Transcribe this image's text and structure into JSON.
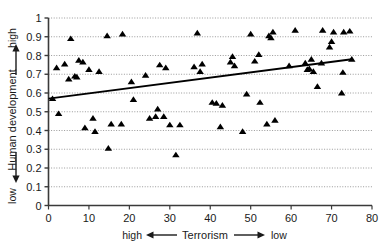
{
  "chart_data": {
    "type": "scatter",
    "title": "",
    "subtitle": "",
    "xlabel": "Terrorism",
    "ylabel": "Human development",
    "xlim": [
      0,
      80
    ],
    "ylim": [
      0,
      1
    ],
    "grid": true,
    "grid_axis": "y",
    "grid_style": "dotted",
    "legend": "none",
    "marker": "triangle",
    "marker_color": "#000000",
    "x_ticks": [
      0,
      10,
      20,
      30,
      40,
      50,
      60,
      70,
      80
    ],
    "x_tick_labels": [
      "0",
      "10",
      "20",
      "30",
      "40",
      "50",
      "60",
      "70",
      "80"
    ],
    "y_ticks": [
      0,
      0.1,
      0.2,
      0.3,
      0.4,
      0.5,
      0.6,
      0.7,
      0.8,
      0.9,
      1
    ],
    "y_tick_labels": [
      "0",
      "0.1",
      "0.2",
      "0.3",
      "0.4",
      "0.5",
      "0.6",
      "0.7",
      "0.8",
      "0.9",
      "1"
    ],
    "x_axis_direction_low_label": "high",
    "x_axis_direction_high_label": "low",
    "y_axis_direction_low_label": "low",
    "y_axis_direction_high_label": "high",
    "annotations": [
      {
        "name": "x-left-word",
        "text": "high"
      },
      {
        "name": "x-right-word",
        "text": "low"
      },
      {
        "name": "y-top-word",
        "text": "high"
      },
      {
        "name": "y-bottom-word",
        "text": "low"
      }
    ],
    "trendline": {
      "type": "linear",
      "x": [
        0,
        75
      ],
      "y": [
        0.57,
        0.78
      ],
      "color": "#000000",
      "width": 2
    },
    "points": [
      {
        "x": 1.0,
        "y": 0.57
      },
      {
        "x": 2.0,
        "y": 0.735
      },
      {
        "x": 2.5,
        "y": 0.49
      },
      {
        "x": 4.0,
        "y": 0.755
      },
      {
        "x": 5.0,
        "y": 0.675
      },
      {
        "x": 5.5,
        "y": 0.89
      },
      {
        "x": 6.5,
        "y": 0.69
      },
      {
        "x": 7.0,
        "y": 0.685
      },
      {
        "x": 7.5,
        "y": 0.775
      },
      {
        "x": 8.5,
        "y": 0.765
      },
      {
        "x": 9.0,
        "y": 0.415
      },
      {
        "x": 10.0,
        "y": 0.725
      },
      {
        "x": 11.0,
        "y": 0.465
      },
      {
        "x": 11.5,
        "y": 0.395
      },
      {
        "x": 12.5,
        "y": 0.715
      },
      {
        "x": 14.5,
        "y": 0.905
      },
      {
        "x": 14.8,
        "y": 0.305
      },
      {
        "x": 15.5,
        "y": 0.435
      },
      {
        "x": 18.0,
        "y": 0.435
      },
      {
        "x": 18.3,
        "y": 0.915
      },
      {
        "x": 20.5,
        "y": 0.66
      },
      {
        "x": 21.0,
        "y": 0.565
      },
      {
        "x": 24.0,
        "y": 0.695
      },
      {
        "x": 25.0,
        "y": 0.465
      },
      {
        "x": 26.5,
        "y": 0.475
      },
      {
        "x": 27.0,
        "y": 0.515
      },
      {
        "x": 27.5,
        "y": 0.75
      },
      {
        "x": 28.5,
        "y": 0.475
      },
      {
        "x": 29.0,
        "y": 0.735
      },
      {
        "x": 30.0,
        "y": 0.43
      },
      {
        "x": 31.5,
        "y": 0.27
      },
      {
        "x": 32.5,
        "y": 0.43
      },
      {
        "x": 36.0,
        "y": 0.74
      },
      {
        "x": 36.8,
        "y": 0.92
      },
      {
        "x": 37.5,
        "y": 0.715
      },
      {
        "x": 38.0,
        "y": 0.755
      },
      {
        "x": 40.5,
        "y": 0.55
      },
      {
        "x": 41.5,
        "y": 0.545
      },
      {
        "x": 42.5,
        "y": 0.42
      },
      {
        "x": 43.0,
        "y": 0.535
      },
      {
        "x": 45.0,
        "y": 0.765
      },
      {
        "x": 45.5,
        "y": 0.795
      },
      {
        "x": 46.0,
        "y": 0.745
      },
      {
        "x": 48.0,
        "y": 0.395
      },
      {
        "x": 49.0,
        "y": 0.595
      },
      {
        "x": 50.0,
        "y": 0.915
      },
      {
        "x": 51.0,
        "y": 0.77
      },
      {
        "x": 52.0,
        "y": 0.805
      },
      {
        "x": 52.3,
        "y": 0.55
      },
      {
        "x": 54.0,
        "y": 0.435
      },
      {
        "x": 54.5,
        "y": 0.905
      },
      {
        "x": 55.0,
        "y": 0.895
      },
      {
        "x": 55.5,
        "y": 0.925
      },
      {
        "x": 56.0,
        "y": 0.455
      },
      {
        "x": 59.5,
        "y": 0.745
      },
      {
        "x": 61.0,
        "y": 0.935
      },
      {
        "x": 63.5,
        "y": 0.76
      },
      {
        "x": 64.0,
        "y": 0.725
      },
      {
        "x": 64.5,
        "y": 0.73
      },
      {
        "x": 65.0,
        "y": 0.78
      },
      {
        "x": 65.5,
        "y": 0.715
      },
      {
        "x": 66.5,
        "y": 0.635
      },
      {
        "x": 67.5,
        "y": 0.76
      },
      {
        "x": 67.8,
        "y": 0.935
      },
      {
        "x": 69.5,
        "y": 0.845
      },
      {
        "x": 70.0,
        "y": 0.875
      },
      {
        "x": 70.5,
        "y": 0.925
      },
      {
        "x": 72.5,
        "y": 0.6
      },
      {
        "x": 72.8,
        "y": 0.71
      },
      {
        "x": 73.0,
        "y": 0.925
      },
      {
        "x": 74.5,
        "y": 0.93
      },
      {
        "x": 75.0,
        "y": 0.78
      }
    ]
  }
}
